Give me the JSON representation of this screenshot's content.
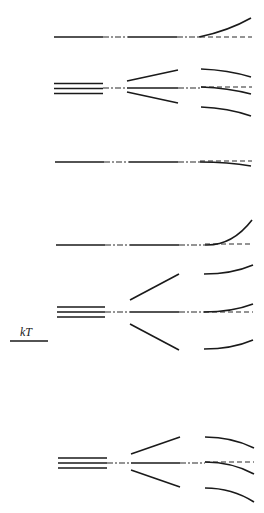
{
  "diagram": {
    "type": "energy-level splitting diagram",
    "colors": {
      "line": "#1a1a1a",
      "background": "#ffffff"
    },
    "scale_label": "kT",
    "rows": [
      {
        "id": "row-1",
        "degeneracy": 1,
        "center_y": 37,
        "right_branches": [
          "rising"
        ]
      },
      {
        "id": "row-2",
        "degeneracy": 3,
        "center_y": 88,
        "right_branches": [
          "falling",
          "falling",
          "falling"
        ]
      },
      {
        "id": "row-3",
        "degeneracy": 1,
        "center_y": 162,
        "right_branches": [
          "slightly-falling"
        ]
      },
      {
        "id": "row-4",
        "degeneracy": 1,
        "center_y": 245,
        "right_branches": [
          "rising"
        ]
      },
      {
        "id": "row-5",
        "degeneracy": 3,
        "center_y": 312,
        "right_branches": [
          "rising",
          "rising",
          "rising"
        ]
      },
      {
        "id": "row-6",
        "degeneracy": 3,
        "center_y": 463,
        "right_branches": [
          "falling",
          "falling",
          "falling"
        ]
      }
    ]
  }
}
